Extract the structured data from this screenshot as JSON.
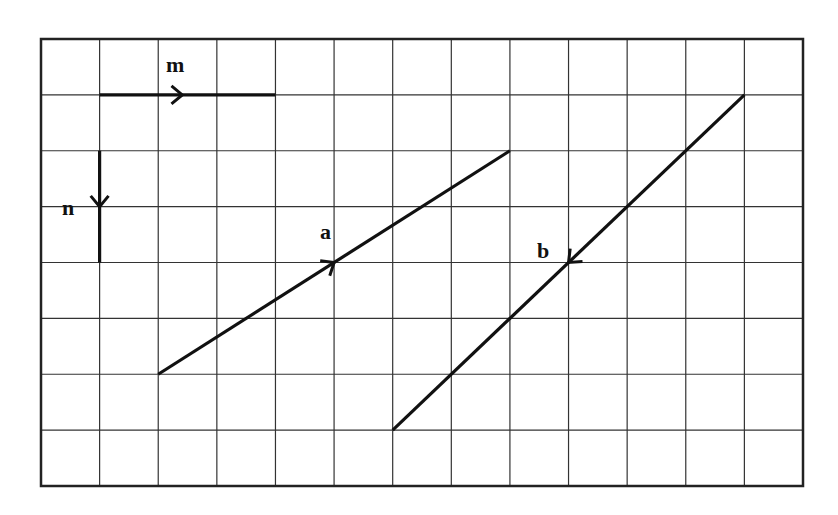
{
  "diagram": {
    "type": "vector-grid",
    "grid": {
      "left": 41,
      "top": 39,
      "right": 803,
      "bottom": 486,
      "cols": 13,
      "rows": 8,
      "line_color": "#333333",
      "border_color": "#222222"
    },
    "vectors": [
      {
        "name": "m",
        "label": "m",
        "from": [
          1,
          1
        ],
        "to": [
          4,
          1
        ],
        "arrow_at": 0.47,
        "label_pos": [
          166,
          72
        ]
      },
      {
        "name": "n",
        "label": "n",
        "from": [
          1,
          2
        ],
        "to": [
          1,
          4
        ],
        "arrow_at": 0.5,
        "label_pos": [
          62,
          215
        ]
      },
      {
        "name": "a",
        "label": "a",
        "from": [
          2,
          6
        ],
        "to": [
          8,
          2
        ],
        "arrow_at": 0.5,
        "label_pos": [
          320,
          239
        ]
      },
      {
        "name": "b",
        "label": "b",
        "from": [
          12,
          1
        ],
        "to": [
          6,
          7
        ],
        "arrow_at": 0.5,
        "label_pos": [
          537,
          258
        ]
      }
    ],
    "stroke_color": "#111111"
  }
}
